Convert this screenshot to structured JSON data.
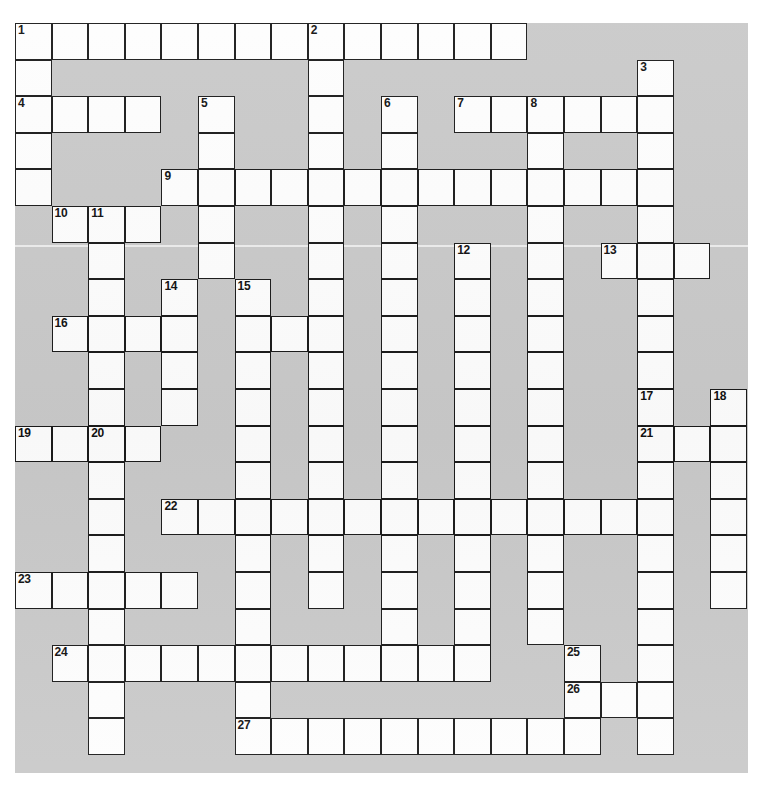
{
  "puzzle": {
    "title": "",
    "grid_columns": 20,
    "grid_rows": 20,
    "cell_size": 36.6,
    "origin_x": 15,
    "origin_y": 23,
    "colors": {
      "board_background": "#c9c9c9",
      "cell_fill": "#fdfdfd",
      "cell_border": "#1a1a1a",
      "page_background": "#ffffff",
      "number_color": "#111111"
    },
    "clue_numbers": [
      1,
      2,
      3,
      4,
      5,
      6,
      7,
      8,
      9,
      10,
      11,
      12,
      13,
      14,
      15,
      16,
      17,
      18,
      19,
      20,
      21,
      22,
      23,
      24,
      25,
      26,
      27
    ],
    "entries": [
      {
        "number": 1,
        "row": 0,
        "col": 0,
        "direction": "across",
        "length": 14
      },
      {
        "number": 1,
        "row": 0,
        "col": 0,
        "direction": "down",
        "length": 5
      },
      {
        "number": 2,
        "row": 0,
        "col": 8,
        "direction": "down",
        "length": 11
      },
      {
        "number": 3,
        "row": 1,
        "col": 17,
        "direction": "down",
        "length": 19
      },
      {
        "number": 4,
        "row": 2,
        "col": 0,
        "direction": "across",
        "length": 4
      },
      {
        "number": 5,
        "row": 2,
        "col": 5,
        "direction": "down",
        "length": 3
      },
      {
        "number": 6,
        "row": 2,
        "col": 10,
        "direction": "down",
        "length": 13
      },
      {
        "number": 7,
        "row": 2,
        "col": 12,
        "direction": "across",
        "length": 5
      },
      {
        "number": 8,
        "row": 2,
        "col": 14,
        "direction": "down",
        "length": 13
      },
      {
        "number": 9,
        "row": 4,
        "col": 4,
        "direction": "across",
        "length": 14
      },
      {
        "number": 10,
        "row": 5,
        "col": 1,
        "direction": "across",
        "length": 3
      },
      {
        "number": 11,
        "row": 5,
        "col": 2,
        "direction": "down",
        "length": 14
      },
      {
        "number": 12,
        "row": 6,
        "col": 12,
        "direction": "down",
        "length": 11
      },
      {
        "number": 13,
        "row": 6,
        "col": 16,
        "direction": "across",
        "length": 3
      },
      {
        "number": 14,
        "row": 7,
        "col": 4,
        "direction": "down",
        "length": 11
      },
      {
        "number": 15,
        "row": 7,
        "col": 6,
        "direction": "down",
        "length": 13
      },
      {
        "number": 16,
        "row": 8,
        "col": 1,
        "direction": "across",
        "length": 4
      },
      {
        "number": 17,
        "row": 10,
        "col": 17,
        "direction": "across",
        "length": 1
      },
      {
        "number": 18,
        "row": 10,
        "col": 19,
        "direction": "down",
        "length": 7
      },
      {
        "number": 19,
        "row": 11,
        "col": 0,
        "direction": "across",
        "length": 4
      },
      {
        "number": 20,
        "row": 11,
        "col": 2,
        "direction": "down",
        "length": 9
      },
      {
        "number": 21,
        "row": 11,
        "col": 17,
        "direction": "across",
        "length": 3
      },
      {
        "number": 22,
        "row": 13,
        "col": 4,
        "direction": "across",
        "length": 14
      },
      {
        "number": 23,
        "row": 15,
        "col": 0,
        "direction": "across",
        "length": 5
      },
      {
        "number": 24,
        "row": 17,
        "col": 1,
        "direction": "across",
        "length": 12
      },
      {
        "number": 25,
        "row": 17,
        "col": 15,
        "direction": "down",
        "length": 2
      },
      {
        "number": 26,
        "row": 18,
        "col": 15,
        "direction": "across",
        "length": 3
      },
      {
        "number": 27,
        "row": 19,
        "col": 6,
        "direction": "across",
        "length": 11
      }
    ],
    "cells": [
      {
        "r": 0,
        "c": 0,
        "n": "1"
      },
      {
        "r": 0,
        "c": 1
      },
      {
        "r": 0,
        "c": 2
      },
      {
        "r": 0,
        "c": 3
      },
      {
        "r": 0,
        "c": 4
      },
      {
        "r": 0,
        "c": 5
      },
      {
        "r": 0,
        "c": 6
      },
      {
        "r": 0,
        "c": 7
      },
      {
        "r": 0,
        "c": 8,
        "n": "2"
      },
      {
        "r": 0,
        "c": 9
      },
      {
        "r": 0,
        "c": 10
      },
      {
        "r": 0,
        "c": 11
      },
      {
        "r": 0,
        "c": 12
      },
      {
        "r": 0,
        "c": 13
      },
      {
        "r": 1,
        "c": 0
      },
      {
        "r": 1,
        "c": 8
      },
      {
        "r": 1,
        "c": 17,
        "n": "3"
      },
      {
        "r": 2,
        "c": 0,
        "n": "4"
      },
      {
        "r": 2,
        "c": 1
      },
      {
        "r": 2,
        "c": 2
      },
      {
        "r": 2,
        "c": 3
      },
      {
        "r": 2,
        "c": 5,
        "n": "5"
      },
      {
        "r": 2,
        "c": 8
      },
      {
        "r": 2,
        "c": 10,
        "n": "6"
      },
      {
        "r": 2,
        "c": 12,
        "n": "7"
      },
      {
        "r": 2,
        "c": 13
      },
      {
        "r": 2,
        "c": 14,
        "n": "8"
      },
      {
        "r": 2,
        "c": 15
      },
      {
        "r": 2,
        "c": 16
      },
      {
        "r": 2,
        "c": 17
      },
      {
        "r": 3,
        "c": 0
      },
      {
        "r": 3,
        "c": 5
      },
      {
        "r": 3,
        "c": 8
      },
      {
        "r": 3,
        "c": 10
      },
      {
        "r": 3,
        "c": 14
      },
      {
        "r": 3,
        "c": 17
      },
      {
        "r": 4,
        "c": 0
      },
      {
        "r": 4,
        "c": 4,
        "n": "9"
      },
      {
        "r": 4,
        "c": 5
      },
      {
        "r": 4,
        "c": 6
      },
      {
        "r": 4,
        "c": 7
      },
      {
        "r": 4,
        "c": 8
      },
      {
        "r": 4,
        "c": 9
      },
      {
        "r": 4,
        "c": 10
      },
      {
        "r": 4,
        "c": 11
      },
      {
        "r": 4,
        "c": 12
      },
      {
        "r": 4,
        "c": 13
      },
      {
        "r": 4,
        "c": 14
      },
      {
        "r": 4,
        "c": 15
      },
      {
        "r": 4,
        "c": 16
      },
      {
        "r": 4,
        "c": 17
      },
      {
        "r": 5,
        "c": 1,
        "n": "10"
      },
      {
        "r": 5,
        "c": 2,
        "n": "11"
      },
      {
        "r": 5,
        "c": 3
      },
      {
        "r": 5,
        "c": 5
      },
      {
        "r": 5,
        "c": 8
      },
      {
        "r": 5,
        "c": 10
      },
      {
        "r": 5,
        "c": 14
      },
      {
        "r": 5,
        "c": 17
      },
      {
        "r": 6,
        "c": 2
      },
      {
        "r": 6,
        "c": 5
      },
      {
        "r": 6,
        "c": 8
      },
      {
        "r": 6,
        "c": 10
      },
      {
        "r": 6,
        "c": 12,
        "n": "12"
      },
      {
        "r": 6,
        "c": 14
      },
      {
        "r": 6,
        "c": 16,
        "n": "13"
      },
      {
        "r": 6,
        "c": 17
      },
      {
        "r": 6,
        "c": 18
      },
      {
        "r": 7,
        "c": 2
      },
      {
        "r": 7,
        "c": 4,
        "n": "14"
      },
      {
        "r": 7,
        "c": 6,
        "n": "15"
      },
      {
        "r": 7,
        "c": 8
      },
      {
        "r": 7,
        "c": 10
      },
      {
        "r": 7,
        "c": 12
      },
      {
        "r": 7,
        "c": 14
      },
      {
        "r": 7,
        "c": 17
      },
      {
        "r": 8,
        "c": 1,
        "n": "16"
      },
      {
        "r": 8,
        "c": 2
      },
      {
        "r": 8,
        "c": 3
      },
      {
        "r": 8,
        "c": 4
      },
      {
        "r": 8,
        "c": 6
      },
      {
        "r": 8,
        "c": 7
      },
      {
        "r": 8,
        "c": 8
      },
      {
        "r": 8,
        "c": 10
      },
      {
        "r": 8,
        "c": 12
      },
      {
        "r": 8,
        "c": 14
      },
      {
        "r": 8,
        "c": 17
      },
      {
        "r": 9,
        "c": 2
      },
      {
        "r": 9,
        "c": 4
      },
      {
        "r": 9,
        "c": 6
      },
      {
        "r": 9,
        "c": 8
      },
      {
        "r": 9,
        "c": 10
      },
      {
        "r": 9,
        "c": 12
      },
      {
        "r": 9,
        "c": 14
      },
      {
        "r": 9,
        "c": 17
      },
      {
        "r": 10,
        "c": 2
      },
      {
        "r": 10,
        "c": 4
      },
      {
        "r": 10,
        "c": 6
      },
      {
        "r": 10,
        "c": 8
      },
      {
        "r": 10,
        "c": 10
      },
      {
        "r": 10,
        "c": 12
      },
      {
        "r": 10,
        "c": 14
      },
      {
        "r": 10,
        "c": 17,
        "n": "17"
      },
      {
        "r": 10,
        "c": 19,
        "n": "18"
      },
      {
        "r": 11,
        "c": 0,
        "n": "19"
      },
      {
        "r": 11,
        "c": 1
      },
      {
        "r": 11,
        "c": 2,
        "n": "20"
      },
      {
        "r": 11,
        "c": 3
      },
      {
        "r": 11,
        "c": 6
      },
      {
        "r": 11,
        "c": 8
      },
      {
        "r": 11,
        "c": 10
      },
      {
        "r": 11,
        "c": 12
      },
      {
        "r": 11,
        "c": 14
      },
      {
        "r": 11,
        "c": 17,
        "n": "21"
      },
      {
        "r": 11,
        "c": 18
      },
      {
        "r": 11,
        "c": 19
      },
      {
        "r": 12,
        "c": 2
      },
      {
        "r": 12,
        "c": 6
      },
      {
        "r": 12,
        "c": 8
      },
      {
        "r": 12,
        "c": 10
      },
      {
        "r": 12,
        "c": 12
      },
      {
        "r": 12,
        "c": 14
      },
      {
        "r": 12,
        "c": 17
      },
      {
        "r": 12,
        "c": 19
      },
      {
        "r": 13,
        "c": 2
      },
      {
        "r": 13,
        "c": 4,
        "n": "22"
      },
      {
        "r": 13,
        "c": 5
      },
      {
        "r": 13,
        "c": 6
      },
      {
        "r": 13,
        "c": 7
      },
      {
        "r": 13,
        "c": 8
      },
      {
        "r": 13,
        "c": 9
      },
      {
        "r": 13,
        "c": 10
      },
      {
        "r": 13,
        "c": 11
      },
      {
        "r": 13,
        "c": 12
      },
      {
        "r": 13,
        "c": 13
      },
      {
        "r": 13,
        "c": 14
      },
      {
        "r": 13,
        "c": 15
      },
      {
        "r": 13,
        "c": 16
      },
      {
        "r": 13,
        "c": 17
      },
      {
        "r": 13,
        "c": 19
      },
      {
        "r": 14,
        "c": 2
      },
      {
        "r": 14,
        "c": 6
      },
      {
        "r": 14,
        "c": 8
      },
      {
        "r": 14,
        "c": 10
      },
      {
        "r": 14,
        "c": 12
      },
      {
        "r": 14,
        "c": 14
      },
      {
        "r": 14,
        "c": 17
      },
      {
        "r": 14,
        "c": 19
      },
      {
        "r": 15,
        "c": 0,
        "n": "23"
      },
      {
        "r": 15,
        "c": 1
      },
      {
        "r": 15,
        "c": 2
      },
      {
        "r": 15,
        "c": 3
      },
      {
        "r": 15,
        "c": 4
      },
      {
        "r": 15,
        "c": 6
      },
      {
        "r": 15,
        "c": 8
      },
      {
        "r": 15,
        "c": 10
      },
      {
        "r": 15,
        "c": 12
      },
      {
        "r": 15,
        "c": 14
      },
      {
        "r": 15,
        "c": 17
      },
      {
        "r": 15,
        "c": 19
      },
      {
        "r": 16,
        "c": 2
      },
      {
        "r": 16,
        "c": 6
      },
      {
        "r": 16,
        "c": 10
      },
      {
        "r": 16,
        "c": 12
      },
      {
        "r": 16,
        "c": 14
      },
      {
        "r": 16,
        "c": 17
      },
      {
        "r": 17,
        "c": 1,
        "n": "24"
      },
      {
        "r": 17,
        "c": 2
      },
      {
        "r": 17,
        "c": 3
      },
      {
        "r": 17,
        "c": 4
      },
      {
        "r": 17,
        "c": 5
      },
      {
        "r": 17,
        "c": 6
      },
      {
        "r": 17,
        "c": 7
      },
      {
        "r": 17,
        "c": 8
      },
      {
        "r": 17,
        "c": 9
      },
      {
        "r": 17,
        "c": 10
      },
      {
        "r": 17,
        "c": 11
      },
      {
        "r": 17,
        "c": 12
      },
      {
        "r": 17,
        "c": 15,
        "n": "25"
      },
      {
        "r": 17,
        "c": 17
      },
      {
        "r": 18,
        "c": 2
      },
      {
        "r": 18,
        "c": 6
      },
      {
        "r": 18,
        "c": 15,
        "n": "26"
      },
      {
        "r": 18,
        "c": 16
      },
      {
        "r": 18,
        "c": 17
      },
      {
        "r": 19,
        "c": 2
      },
      {
        "r": 19,
        "c": 6,
        "n": "27"
      },
      {
        "r": 19,
        "c": 7
      },
      {
        "r": 19,
        "c": 8
      },
      {
        "r": 19,
        "c": 9
      },
      {
        "r": 19,
        "c": 10
      },
      {
        "r": 19,
        "c": 11
      },
      {
        "r": 19,
        "c": 12
      },
      {
        "r": 19,
        "c": 13
      },
      {
        "r": 19,
        "c": 14
      },
      {
        "r": 19,
        "c": 15
      },
      {
        "r": 19,
        "c": 17
      }
    ]
  }
}
